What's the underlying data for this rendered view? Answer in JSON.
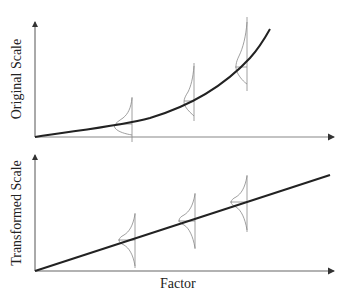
{
  "top_panel": {
    "ylabel": "Original Scale",
    "curve_type": "exponential",
    "distributions": [
      {
        "x": 132,
        "shape": "right-skewed, narrow"
      },
      {
        "x": 194,
        "shape": "right-skewed, wider"
      },
      {
        "x": 247,
        "shape": "right-skewed, widest"
      }
    ]
  },
  "bottom_panel": {
    "ylabel": "Transformed Scale",
    "curve_type": "linear",
    "distributions": [
      {
        "x": 135,
        "shape": "symmetric normal"
      },
      {
        "x": 195,
        "shape": "symmetric normal"
      },
      {
        "x": 247,
        "shape": "symmetric normal"
      }
    ]
  },
  "xlabel": "Factor",
  "colors": {
    "axis": "#555555",
    "curve": "#222222",
    "distribution": "#888888"
  }
}
